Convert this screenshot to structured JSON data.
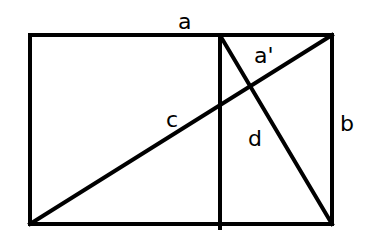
{
  "diagram": {
    "stroke_color": "#000000",
    "background": "#ffffff",
    "labels": {
      "top_side": "a",
      "sub_segment": "a'",
      "right_side": "b",
      "long_diagonal": "c",
      "short_diagonal": "d"
    }
  }
}
